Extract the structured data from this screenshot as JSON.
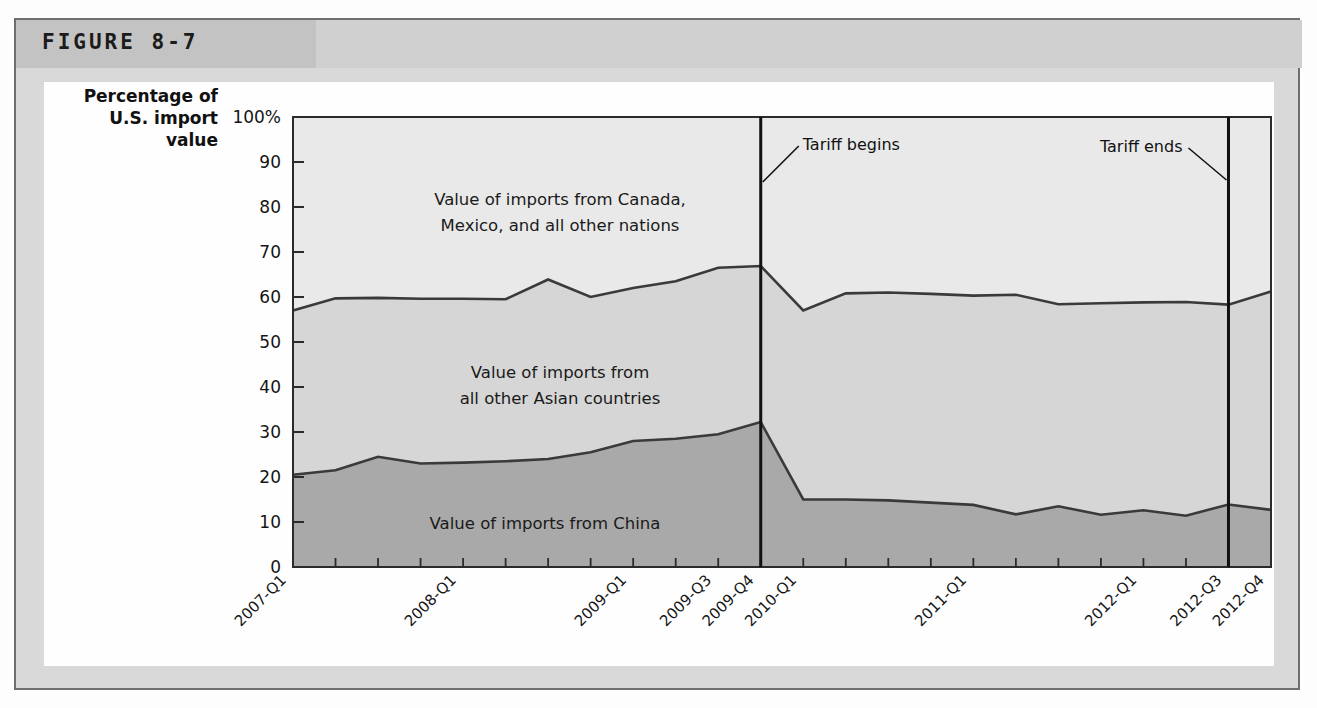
{
  "figure": {
    "label": "FIGURE 8-7"
  },
  "axis": {
    "y_title_line1": "Percentage of",
    "y_title_line2": "U.S. import",
    "y_title_line3": "value",
    "y_ticks": [
      "100%",
      "90",
      "80",
      "70",
      "60",
      "50",
      "40",
      "30",
      "20",
      "10",
      "0"
    ]
  },
  "band_labels": {
    "top_line1": "Value of imports from Canada,",
    "top_line2": "Mexico, and all other nations",
    "middle_line1": "Value of imports from",
    "middle_line2": "all other Asian countries",
    "bottom": "Value of imports from China"
  },
  "annotations": {
    "tariff_begins": "Tariff begins",
    "tariff_ends": "Tariff ends"
  },
  "colors": {
    "band_top": "#e9e9e9",
    "band_middle": "#d6d6d6",
    "band_bottom": "#a9a9a9",
    "line": "#3a3a3a",
    "frame": "#6f6f6f",
    "header_dark": "#c3c3c3",
    "header_light": "#d0d0d0"
  },
  "chart_data": {
    "type": "area",
    "title": "FIGURE 8-7",
    "subtitle": "",
    "xlabel": "",
    "ylabel": "Percentage of U.S. import value",
    "ylim": [
      0,
      100
    ],
    "grid": false,
    "legend_position": "inline-band-labels",
    "stacked": true,
    "x": [
      "2007-Q1",
      "2007-Q2",
      "2007-Q3",
      "2007-Q4",
      "2008-Q1",
      "2008-Q2",
      "2008-Q3",
      "2008-Q4",
      "2009-Q1",
      "2009-Q2",
      "2009-Q3",
      "2009-Q4",
      "2010-Q1",
      "2010-Q2",
      "2010-Q3",
      "2010-Q4",
      "2011-Q1",
      "2011-Q2",
      "2011-Q3",
      "2011-Q4",
      "2012-Q1",
      "2012-Q2",
      "2012-Q3",
      "2012-Q4"
    ],
    "x_tick_labels_shown": [
      "2007-Q1",
      "2008-Q1",
      "2009-Q1",
      "2009-Q3",
      "2009-Q4",
      "2010-Q1",
      "2011-Q1",
      "2012-Q1",
      "2012-Q3",
      "2012-Q4"
    ],
    "series": [
      {
        "name": "Value of imports from China",
        "color": "#a9a9a9",
        "values": [
          20.5,
          21.5,
          24.5,
          23.0,
          23.2,
          23.5,
          24.0,
          25.5,
          28.0,
          28.5,
          29.5,
          32.2,
          15.0,
          15.0,
          14.8,
          14.3,
          13.8,
          11.7,
          13.5,
          11.6,
          12.6,
          11.4,
          13.9,
          12.7
        ]
      },
      {
        "name": "Value of imports from all other Asian countries",
        "color": "#d6d6d6",
        "values": [
          36.5,
          38.2,
          35.3,
          36.6,
          36.4,
          36.0,
          39.9,
          34.5,
          34.0,
          35.0,
          37.0,
          34.7,
          42.0,
          45.8,
          46.2,
          46.4,
          46.5,
          48.8,
          44.9,
          47.0,
          46.2,
          47.5,
          44.4,
          48.5
        ]
      },
      {
        "name": "Value of imports from Canada, Mexico, and all other nations",
        "color": "#e9e9e9",
        "values": [
          43.0,
          40.3,
          40.2,
          40.4,
          40.4,
          40.5,
          36.1,
          40.0,
          38.0,
          36.5,
          33.5,
          33.1,
          43.0,
          39.2,
          39.0,
          39.3,
          39.7,
          39.5,
          41.6,
          41.4,
          41.2,
          41.1,
          41.7,
          38.8
        ]
      }
    ],
    "cumulative_china": [
      20.5,
      21.5,
      24.5,
      23.0,
      23.2,
      23.5,
      24.0,
      25.5,
      28.0,
      28.5,
      29.5,
      32.2,
      15.0,
      15.0,
      14.8,
      14.3,
      13.8,
      11.7,
      13.5,
      11.6,
      12.6,
      11.4,
      13.9,
      12.7
    ],
    "cumulative_asia": [
      57.0,
      59.7,
      59.8,
      59.6,
      59.6,
      59.5,
      63.9,
      60.0,
      62.0,
      63.5,
      66.5,
      66.9,
      57.0,
      60.8,
      61.0,
      60.7,
      60.3,
      60.5,
      58.4,
      58.6,
      58.8,
      58.9,
      58.3,
      61.2
    ],
    "vertical_markers": [
      {
        "label": "Tariff begins",
        "x": "2009-Q4"
      },
      {
        "label": "Tariff ends",
        "x": "2012-Q3"
      }
    ]
  }
}
